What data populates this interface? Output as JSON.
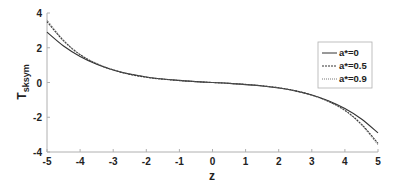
{
  "chart_data": {
    "type": "line",
    "title": "",
    "xlabel": "z",
    "ylabel": "T",
    "ylabel_subscript": "sksym",
    "xlim": [
      -5,
      5
    ],
    "ylim": [
      -4,
      4
    ],
    "xticks": [
      -5,
      -4,
      -3,
      -2,
      -1,
      0,
      1,
      2,
      3,
      4,
      5
    ],
    "yticks": [
      -4,
      -2,
      0,
      2,
      4
    ],
    "grid": false,
    "legend_position": "upper right",
    "x": [
      -5,
      -4.5,
      -4,
      -3.5,
      -3,
      -2.5,
      -2,
      -1.5,
      -1,
      -0.5,
      0,
      0.5,
      1,
      1.5,
      2,
      2.5,
      3,
      3.5,
      4,
      4.5,
      5
    ],
    "series": [
      {
        "name": "a*=0",
        "style": "solid",
        "values": [
          2.9,
          2.1,
          1.5,
          1.05,
          0.72,
          0.48,
          0.32,
          0.2,
          0.12,
          0.05,
          0.0,
          -0.05,
          -0.12,
          -0.2,
          -0.32,
          -0.48,
          -0.72,
          -1.05,
          -1.5,
          -2.1,
          -2.9
        ]
      },
      {
        "name": "a*=0.5",
        "style": "dashed",
        "values": [
          3.5,
          2.4,
          1.6,
          1.08,
          0.72,
          0.47,
          0.3,
          0.19,
          0.11,
          0.05,
          0.0,
          -0.05,
          -0.11,
          -0.19,
          -0.3,
          -0.47,
          -0.72,
          -1.08,
          -1.6,
          -2.4,
          -3.5
        ]
      },
      {
        "name": "a*=0.9",
        "style": "dotted",
        "values": [
          3.6,
          2.45,
          1.62,
          1.1,
          0.74,
          0.49,
          0.31,
          0.2,
          0.12,
          0.05,
          0.0,
          -0.05,
          -0.12,
          -0.2,
          -0.31,
          -0.49,
          -0.74,
          -1.1,
          -1.62,
          -2.45,
          -3.6
        ]
      }
    ]
  },
  "legend": {
    "items": [
      {
        "label": "a*=0"
      },
      {
        "label": "a*=0.5"
      },
      {
        "label": "a*=0.9"
      }
    ]
  },
  "colors": {
    "axis": "#b0b0b0",
    "curve": "#333333",
    "text": "#222222"
  }
}
